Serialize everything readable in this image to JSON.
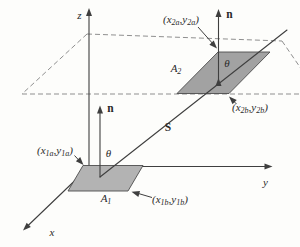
{
  "figure": {
    "background": "#fdfdfb",
    "line_color": "#3f3f3f",
    "dash_color": "#8f8f8f",
    "edge_color": "#4d4d4d",
    "area1_fill": "#b3b3b3",
    "area2_fill": "#a2a2a2",
    "text_color": "#2a2a2a"
  },
  "labels": {
    "axis_z": "z",
    "axis_y": "y",
    "axis_x": "x",
    "normal1": "n",
    "normal2": "n",
    "vector_s": "S",
    "theta1": "θ",
    "theta2": "θ",
    "area1": {
      "base": "A",
      "sub": "1"
    },
    "area2": {
      "base": "A",
      "sub": "2"
    },
    "p1a": {
      "pre": "(x",
      "sub1": "1a",
      "mid": ",y",
      "sub2": "1a",
      "post": ")"
    },
    "p1b": {
      "pre": "(x",
      "sub1": "1b",
      "mid": ",y",
      "sub2": "1b",
      "post": ")"
    },
    "p2a": {
      "pre": "(x",
      "sub1": "2a",
      "mid": ",y",
      "sub2": "2a",
      "post": ")"
    },
    "p2b": {
      "pre": "(x",
      "sub1": "2b",
      "mid": ",y",
      "sub2": "2b",
      "post": ")"
    }
  }
}
